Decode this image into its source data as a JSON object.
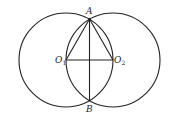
{
  "diagram": {
    "type": "geometry",
    "points": {
      "A": {
        "label": "A",
        "x": 89.5,
        "y": 19
      },
      "B": {
        "label": "B",
        "x": 89.5,
        "y": 101
      },
      "O1": {
        "label": "O",
        "sub": "1",
        "x": 66,
        "y": 60
      },
      "O2": {
        "label": "O",
        "sub": "2",
        "x": 113,
        "y": 60
      }
    },
    "circles": [
      {
        "center": "O1",
        "r": 47
      },
      {
        "center": "O2",
        "r": 47
      }
    ],
    "segments": [
      [
        "A",
        "O1"
      ],
      [
        "A",
        "O2"
      ],
      [
        "O1",
        "O2"
      ],
      [
        "A",
        "B"
      ]
    ],
    "stroke_color": "#222222"
  }
}
